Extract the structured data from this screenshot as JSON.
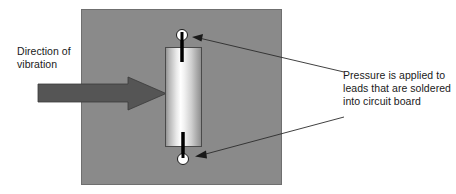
{
  "diagram": {
    "background_color": "#ffffff",
    "width": 456,
    "height": 194
  },
  "board": {
    "name": "circuit-board-panel",
    "fill_color": "#8a8a8a",
    "border_color": "#6f6f6f",
    "x": 81,
    "y": 9,
    "width": 201,
    "height": 176
  },
  "component": {
    "name": "capacitor-body",
    "border_color": "#4a4a4a",
    "gradient_edge_color": "#8c8c8c",
    "gradient_highlight_color": "#ffffff",
    "x": 165,
    "y": 47,
    "width": 37,
    "height": 100
  },
  "leads": [
    {
      "name": "top-lead",
      "pad_center_x": 182,
      "pad_center_y": 35,
      "pad_radius": 5.5,
      "pad_fill_color": "#ffffff",
      "pad_border_color": "#1a1a1a",
      "lead_color": "#000000",
      "lead_from_y": 32,
      "lead_to_y": 62
    },
    {
      "name": "bottom-lead",
      "pad_center_x": 183,
      "pad_center_y": 159,
      "pad_radius": 5.5,
      "pad_fill_color": "#ffffff",
      "pad_border_color": "#1a1a1a",
      "lead_color": "#000000",
      "lead_from_y": 132,
      "lead_to_y": 162
    }
  ],
  "vibration_arrow": {
    "name": "vibration-direction-arrow",
    "fill_color": "#555555",
    "border_color": "#3a3a3a",
    "shaft_x": 38,
    "shaft_top_y": 84,
    "shaft_bottom_y": 102,
    "head_start_x": 128,
    "head_top_y": 77,
    "head_bottom_y": 110,
    "tip_x": 166,
    "tip_y": 93.5,
    "direction": "right"
  },
  "labels": {
    "direction": {
      "name": "direction-of-vibration-label",
      "lines": [
        "Direction of",
        "vibration"
      ],
      "text": "Direction of\nvibration",
      "color": "#1a1a1a"
    },
    "pressure": {
      "name": "pressure-note-label",
      "lines": [
        "Pressure is applied to",
        "leads that are soldered",
        "into circuit board"
      ],
      "text": "Pressure is applied to\nleads that are soldered\ninto circuit board",
      "color": "#1a1a1a"
    }
  },
  "leader_lines": [
    {
      "name": "leader-line-top",
      "color": "#2b2b2b",
      "from_x": 344,
      "from_y": 72,
      "to_x": 193,
      "to_y": 38,
      "arrowhead": "to-end"
    },
    {
      "name": "leader-line-bottom",
      "color": "#2b2b2b",
      "from_x": 344,
      "from_y": 117,
      "to_x": 196,
      "to_y": 155,
      "arrowhead": "to-end"
    }
  ]
}
